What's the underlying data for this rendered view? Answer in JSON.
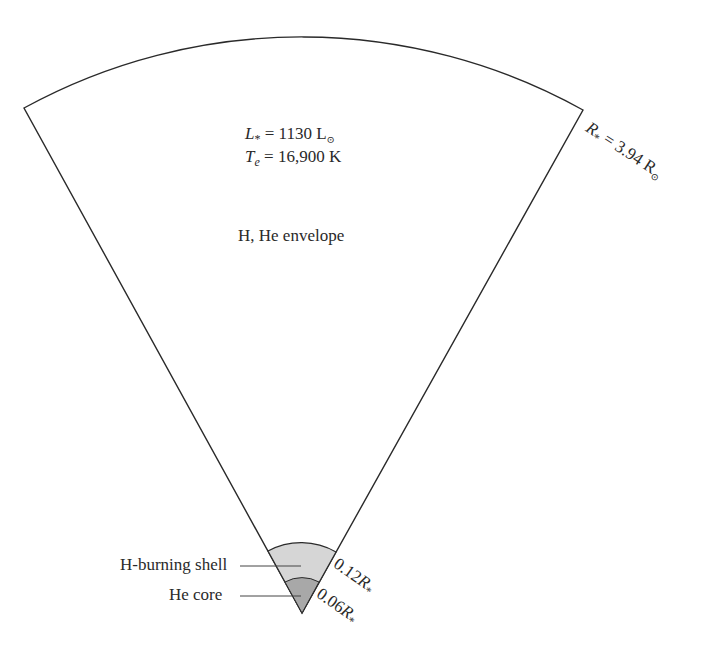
{
  "diagram": {
    "stats": {
      "luminosity_symbol": "L",
      "luminosity_sub": "*",
      "luminosity_value": "= 1130 L",
      "luminosity_unit_sub": "⊙",
      "temperature_symbol": "T",
      "temperature_sub": "e",
      "temperature_value": "= 16,900 K"
    },
    "radius_label": {
      "symbol": "R",
      "sub": "*",
      "value": "= 3.94 R",
      "unit_sub": "⊙"
    },
    "regions": [
      {
        "name": "H, He envelope",
        "label": "H, He envelope",
        "color": "#ffffff"
      },
      {
        "name": "H-burning shell",
        "label": "H-burning shell",
        "color": "#d6d6d6",
        "outer_radius_label": "0.12",
        "outer_radius_symbol": "R",
        "outer_radius_sub": "*"
      },
      {
        "name": "He core",
        "label": "He core",
        "color": "#a8a8a8",
        "outer_radius_label": "0.06",
        "outer_radius_symbol": "R",
        "outer_radius_sub": "*"
      }
    ]
  }
}
